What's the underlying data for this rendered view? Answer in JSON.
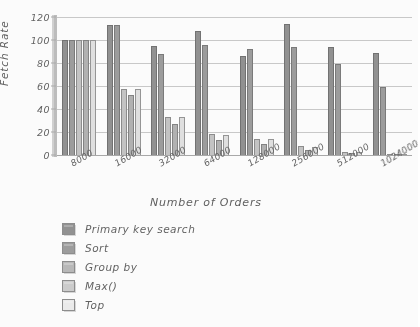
{
  "chart_data": {
    "type": "bar",
    "title": "",
    "xlabel": "Number of Orders",
    "ylabel": "Fetch Rate",
    "ylim": [
      0,
      120
    ],
    "yticks": [
      0,
      20,
      40,
      60,
      80,
      100,
      120
    ],
    "grid": true,
    "legend_position": "below-left",
    "categories": [
      "8000",
      "16000",
      "32000",
      "64000",
      "128000",
      "256000",
      "512000",
      "1024000"
    ],
    "series": [
      {
        "name": "Primary key search",
        "color": "#8f8f8f",
        "values": [
          100,
          113,
          95,
          108,
          86,
          114,
          94,
          89
        ]
      },
      {
        "name": "Sort",
        "color": "#9b9b9b",
        "values": [
          100,
          113,
          88,
          96,
          92,
          94,
          79,
          59
        ]
      },
      {
        "name": "Group by",
        "color": "#b8b8b8",
        "values": [
          100,
          57,
          33,
          18,
          14,
          8,
          3,
          1
        ]
      },
      {
        "name": "Max()",
        "color": "#cccccc",
        "values": [
          100,
          52,
          27,
          13,
          10,
          4,
          2,
          1
        ]
      },
      {
        "name": "Top",
        "color": "#ededed",
        "values": [
          100,
          57,
          33,
          17,
          14,
          7,
          3,
          1
        ]
      }
    ]
  },
  "axes": {
    "y_title": "Fetch Rate",
    "x_title": "Number of Orders",
    "y_tick_labels": [
      "0",
      "20",
      "40",
      "60",
      "80",
      "100",
      "120"
    ],
    "x_tick_labels": [
      "8000",
      "16000",
      "32000",
      "64000",
      "128000",
      "256000",
      "512000",
      "1024000"
    ]
  },
  "legend": {
    "items": [
      {
        "label": "Primary key search"
      },
      {
        "label": "Sort"
      },
      {
        "label": "Group by"
      },
      {
        "label": "Max()"
      },
      {
        "label": "Top"
      }
    ]
  },
  "artifact": {
    "bottom_smudge": ""
  }
}
